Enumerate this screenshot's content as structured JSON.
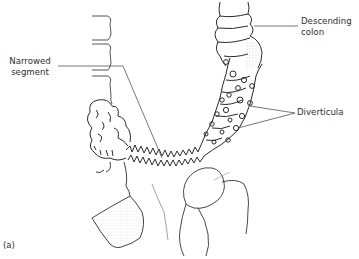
{
  "figure": {
    "panel_label": "(a)",
    "labels": {
      "narrowed_segment": {
        "line1": "Narrowed",
        "line2": "segment"
      },
      "descending_colon": {
        "line1": "Descending",
        "line2": "colon"
      },
      "diverticula": "Diverticula"
    },
    "colors": {
      "line": "#2b2b2b",
      "leader": "#555555",
      "stipple": "#9a9a9a",
      "background": "#ffffff"
    }
  }
}
